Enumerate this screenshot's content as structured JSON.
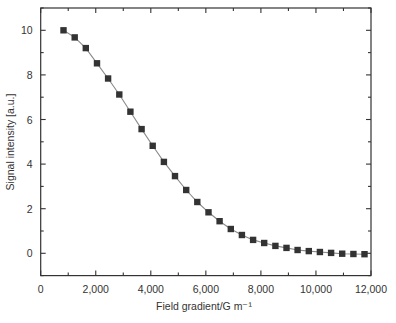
{
  "chart_data": {
    "type": "line",
    "title": "",
    "xlabel": "Field gradient/G m⁻¹",
    "ylabel": "Signal intensity [a.u.]",
    "xlim": [
      0,
      12000
    ],
    "ylim": [
      -1,
      11
    ],
    "grid": false,
    "legend": null,
    "x_ticks": [
      0,
      2000,
      4000,
      6000,
      8000,
      10000,
      12000
    ],
    "x_tick_labels": [
      "0",
      "2,000",
      "4,000",
      "6,000",
      "8,000",
      "10,000",
      "12,000"
    ],
    "x_minor_ticks": [
      1000,
      3000,
      5000,
      7000,
      9000,
      11000
    ],
    "y_ticks": [
      0,
      2,
      4,
      6,
      8,
      10
    ],
    "y_tick_labels": [
      "0",
      "2",
      "4",
      "6",
      "8",
      "10"
    ],
    "y_minor_ticks": [
      -1,
      1,
      3,
      5,
      7,
      9,
      11
    ],
    "series": [
      {
        "name": "Signal intensity",
        "marker": "square",
        "x": [
          830,
          1235,
          1640,
          2045,
          2450,
          2855,
          3260,
          3665,
          4070,
          4475,
          4880,
          5285,
          5690,
          6095,
          6500,
          6905,
          7310,
          7715,
          8120,
          8525,
          8930,
          9335,
          9740,
          10145,
          10550,
          10955,
          11360,
          11765
        ],
        "values": [
          10.0,
          9.68,
          9.2,
          8.52,
          7.84,
          7.12,
          6.35,
          5.57,
          4.82,
          4.1,
          3.46,
          2.84,
          2.3,
          1.84,
          1.44,
          1.09,
          0.82,
          0.6,
          0.46,
          0.33,
          0.24,
          0.15,
          0.1,
          0.06,
          0.02,
          -0.02,
          -0.03,
          -0.04
        ]
      }
    ]
  },
  "colors": {
    "axis": "#333333",
    "line": "#8a8a8a",
    "marker": "#333333",
    "background": "#ffffff"
  }
}
